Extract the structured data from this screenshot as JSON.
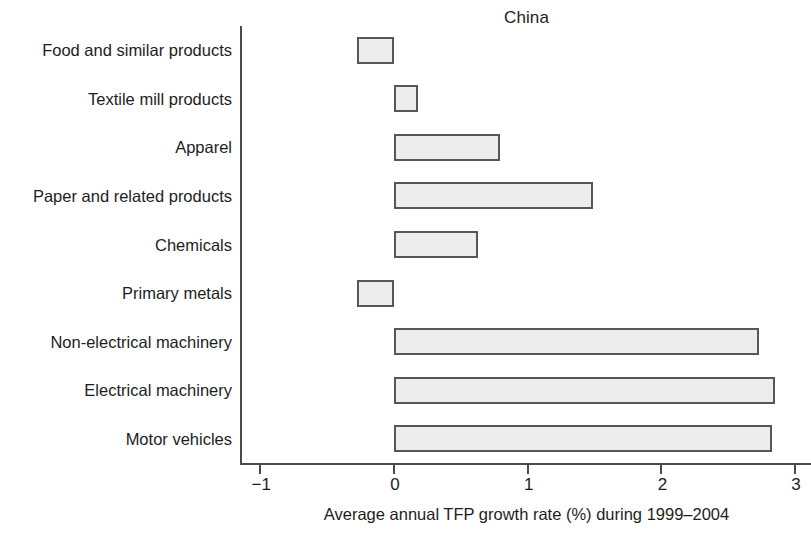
{
  "chart_data": {
    "type": "bar",
    "orientation": "horizontal",
    "title": "China",
    "xlabel": "Average annual TFP growth rate (%) during 1999–2004",
    "ylabel": "",
    "categories": [
      "Food and similar products",
      "Textile mill products",
      "Apparel",
      "Paper and related products",
      "Chemicals",
      "Primary metals",
      "Non-electrical machinery",
      "Electrical machinery",
      "Motor vehicles"
    ],
    "values": [
      -0.28,
      0.18,
      0.79,
      1.49,
      0.63,
      -0.28,
      2.73,
      2.85,
      2.83
    ],
    "xlim": [
      -1.15,
      3.12
    ],
    "xticks": [
      -1,
      0,
      1,
      2,
      3
    ],
    "xtick_labels": [
      "−1",
      "0",
      "1",
      "2",
      "3"
    ],
    "grid": false,
    "legend": null,
    "bar_fill_color": "#ededed",
    "bar_edge_color": "#575757",
    "axis_color": "#4a4a4a",
    "text_color": "#1d1d1d",
    "background_color": "#ffffff"
  }
}
